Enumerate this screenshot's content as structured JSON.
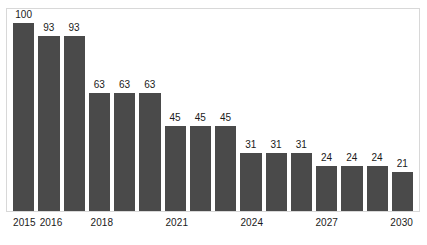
{
  "chart_data": {
    "type": "bar",
    "title": "",
    "subtitle": "",
    "xlabel": "",
    "ylabel": "",
    "grid": false,
    "legend": false,
    "ylim": [
      0,
      100
    ],
    "categories": [
      "2015",
      "2016",
      "2017",
      "2018",
      "2019",
      "2020",
      "2021",
      "2022",
      "2023",
      "2024",
      "2025",
      "2026",
      "2027",
      "2028",
      "2029",
      "2030"
    ],
    "tick_labels": [
      "2015",
      "2016",
      "",
      "2018",
      "",
      "",
      "2021",
      "",
      "",
      "2024",
      "",
      "",
      "2027",
      "",
      "",
      "2030"
    ],
    "values": [
      100,
      93,
      93,
      63,
      63,
      63,
      45,
      45,
      45,
      31,
      31,
      31,
      24,
      24,
      24,
      21
    ],
    "value_labels": [
      "100",
      "93",
      "93",
      "63",
      "63",
      "63",
      "45",
      "45",
      "45",
      "31",
      "31",
      "31",
      "24",
      "24",
      "24",
      "21"
    ],
    "series": [
      {
        "name": "",
        "values": [
          100,
          93,
          93,
          63,
          63,
          63,
          45,
          45,
          45,
          31,
          31,
          31,
          24,
          24,
          24,
          21
        ]
      }
    ],
    "colors": {
      "bar": "#4a4a4a",
      "label": "#1a1a1a",
      "frame": "#d8d8d8",
      "background": "#ffffff"
    }
  }
}
